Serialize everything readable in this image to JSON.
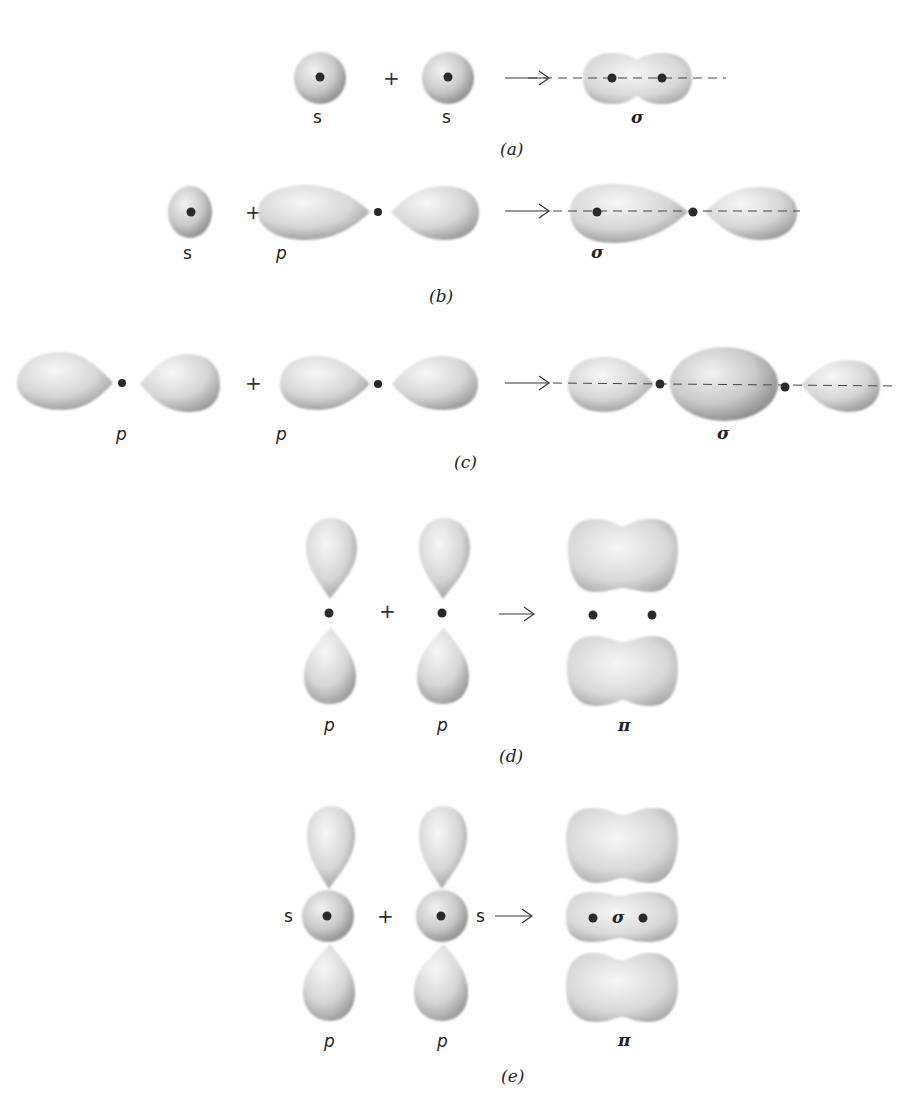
{
  "figure": {
    "panels": [
      {
        "id": "a",
        "caption": "(a)",
        "reactants": [
          {
            "label": "s"
          },
          {
            "label": "s"
          }
        ],
        "operator": "+",
        "arrow": "→",
        "product": {
          "label": "σ",
          "type": "sigma"
        }
      },
      {
        "id": "b",
        "caption": "(b)",
        "reactants": [
          {
            "label": "s"
          },
          {
            "label": "p"
          }
        ],
        "operator": "+",
        "arrow": "→",
        "product": {
          "label": "σ",
          "type": "sigma"
        }
      },
      {
        "id": "c",
        "caption": "(c)",
        "reactants": [
          {
            "label": "p"
          },
          {
            "label": "p"
          }
        ],
        "operator": "+",
        "arrow": "→",
        "product": {
          "label": "σ",
          "type": "sigma"
        }
      },
      {
        "id": "d",
        "caption": "(d)",
        "reactants": [
          {
            "label": "p"
          },
          {
            "label": "p"
          }
        ],
        "operator": "+",
        "arrow": "→",
        "product": {
          "label": "π",
          "type": "pi"
        }
      },
      {
        "id": "e",
        "caption": "(e)",
        "reactants": [
          {
            "label": "p",
            "s_label": "s"
          },
          {
            "label": "p",
            "s_label": "s"
          }
        ],
        "operator": "+",
        "arrow": "→",
        "product": {
          "label": "π",
          "inner_label": "σ",
          "type": "sigma+pi"
        }
      }
    ]
  },
  "colors": {
    "orbital_light": "#f4f4f4",
    "orbital_mid": "#d2d2d2",
    "orbital_dark": "#8c8c8c",
    "nucleus": "#2a2a2a",
    "axis_line": "#444444",
    "text": "#222222"
  }
}
